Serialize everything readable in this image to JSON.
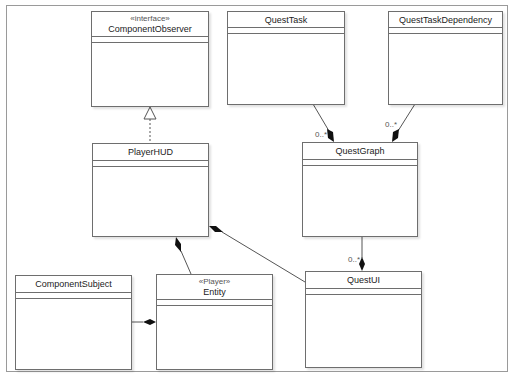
{
  "diagram": {
    "type": "UML class diagram",
    "classes": [
      {
        "id": "component_observer",
        "stereotype": "«interface»",
        "name": "ComponentObserver"
      },
      {
        "id": "quest_task",
        "stereotype": "",
        "name": "QuestTask"
      },
      {
        "id": "quest_task_dependency",
        "stereotype": "",
        "name": "QuestTaskDependency"
      },
      {
        "id": "player_hud",
        "stereotype": "",
        "name": "PlayerHUD"
      },
      {
        "id": "quest_graph",
        "stereotype": "",
        "name": "QuestGraph"
      },
      {
        "id": "component_subject",
        "stereotype": "",
        "name": "ComponentSubject"
      },
      {
        "id": "entity",
        "stereotype": "«Player»",
        "name": "Entity"
      },
      {
        "id": "quest_ui",
        "stereotype": "",
        "name": "QuestUI"
      }
    ],
    "relations": [
      {
        "from": "PlayerHUD",
        "to": "ComponentObserver",
        "kind": "realization"
      },
      {
        "from": "QuestTask",
        "to": "QuestGraph",
        "kind": "composition",
        "multiplicity": "0..*"
      },
      {
        "from": "QuestTaskDependency",
        "to": "QuestGraph",
        "kind": "composition",
        "multiplicity": "0..*"
      },
      {
        "from": "QuestGraph",
        "to": "QuestUI",
        "kind": "composition",
        "multiplicity": "0..*"
      },
      {
        "from": "Entity",
        "to": "PlayerHUD",
        "kind": "composition"
      },
      {
        "from": "QuestUI",
        "to": "PlayerHUD",
        "kind": "composition"
      },
      {
        "from": "ComponentSubject",
        "to": "Entity",
        "kind": "composition"
      }
    ],
    "multiplicity_labels": {
      "quest_task_graph": "0..*",
      "quest_dep_graph": "0..*",
      "graph_ui": "0..*"
    }
  }
}
